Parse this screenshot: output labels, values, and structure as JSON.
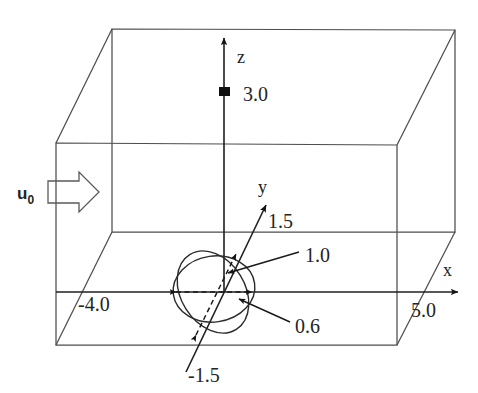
{
  "figure": {
    "background_color": "#ffffff",
    "line_color": "#4d4d4d",
    "text_color": "#242424"
  },
  "axes": {
    "x": {
      "label": "x",
      "max_value": "5.0",
      "min_value": "-4.0"
    },
    "y": {
      "label": "y",
      "max_value": "1.5",
      "min_value": "-1.5"
    },
    "z": {
      "label": "z",
      "max_value": "3.0"
    }
  },
  "inlet": {
    "symbol": "u",
    "subscript": "0"
  },
  "body": {
    "semi_axis_y": "1.0",
    "semi_axis_x": "0.6"
  },
  "labels": {
    "z_value": "3.0",
    "z_axis": "z",
    "y_axis": "y",
    "y_positive": "1.5",
    "y_negative": "-1.5",
    "x_axis": "x",
    "x_positive": "5.0",
    "x_negative": "-4.0",
    "radius_a": "1.0",
    "radius_b": "0.6"
  }
}
